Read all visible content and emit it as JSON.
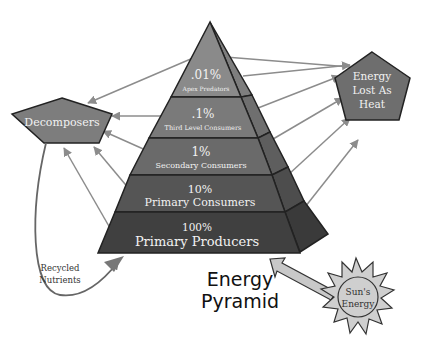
{
  "title": {
    "line1": "Energy",
    "line2": "Pyramid"
  },
  "pyramid": {
    "levels": [
      {
        "percent": ".01%",
        "name": "Apex Predators",
        "color": "#8a8a8a"
      },
      {
        "percent": ".1%",
        "name": "Third Level Consumers",
        "color": "#7a7a7a"
      },
      {
        "percent": "1%",
        "name": "Secondary Consumers",
        "color": "#6a6a6a"
      },
      {
        "percent": "10%",
        "name": "Primary Consumers",
        "color": "#555555"
      },
      {
        "percent": "100%",
        "name": "Primary Producers",
        "color": "#404040"
      }
    ]
  },
  "decomposers": {
    "label": "Decomposers",
    "color": "#7d7d7d"
  },
  "heat": {
    "line1": "Energy",
    "line2": "Lost As",
    "line3": "Heat",
    "color": "#6e6e6e"
  },
  "recycled": {
    "line1": "Recycled",
    "line2": "Nutrients"
  },
  "sun": {
    "line1": "Sun's",
    "line2": "Energy",
    "color": "#cfcfcf"
  },
  "colors": {
    "arrow": "#8c8c8c",
    "outline": "#222222"
  }
}
